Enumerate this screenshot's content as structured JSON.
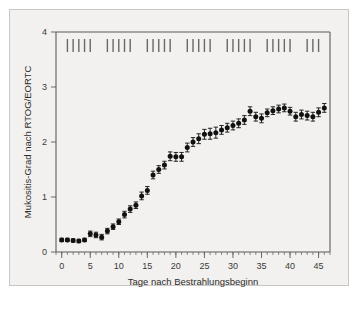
{
  "figure": {
    "background_color": "#f2f1ef",
    "frame_color": "#c9c7c3",
    "marker_color": "#111111",
    "axis_color": "#5d5b58",
    "fraction_tick_color": "#6a6866"
  },
  "chart_data": {
    "type": "scatter",
    "title": "",
    "subtitle": "",
    "xlabel": "Tage nach Bestrahlungsbeginn",
    "ylabel": "Mukositis-Grad nach RTOG/EORTC",
    "xlim": [
      -1,
      47
    ],
    "ylim": [
      0,
      4
    ],
    "xticks": [
      0,
      5,
      10,
      15,
      20,
      25,
      30,
      35,
      40,
      45
    ],
    "xticklabels": [
      "0",
      "5",
      "10",
      "15",
      "20",
      "25",
      "30",
      "35",
      "40",
      "45"
    ],
    "xminor_step": 1,
    "yticks": [
      0,
      1,
      2,
      3,
      4
    ],
    "yticklabels": [
      "0",
      "1",
      "2",
      "3",
      "4"
    ],
    "grid": false,
    "legend": null,
    "legend_position": "none",
    "series": [
      {
        "name": "Mukositis-Grad (Mittelwert ± SEM)",
        "marker": "filled-circle",
        "error_bars": "vertical",
        "x": [
          0,
          1,
          2,
          3,
          4,
          5,
          6,
          7,
          8,
          9,
          10,
          11,
          12,
          13,
          14,
          15,
          16,
          17,
          18,
          19,
          20,
          21,
          22,
          23,
          24,
          25,
          26,
          27,
          28,
          29,
          30,
          31,
          32,
          33,
          34,
          35,
          36,
          37,
          38,
          39,
          40,
          41,
          42,
          43,
          44,
          45,
          46
        ],
        "y": [
          0.22,
          0.22,
          0.21,
          0.2,
          0.22,
          0.33,
          0.31,
          0.27,
          0.38,
          0.46,
          0.55,
          0.68,
          0.78,
          0.85,
          1.02,
          1.12,
          1.4,
          1.5,
          1.58,
          1.74,
          1.73,
          1.73,
          1.9,
          2.0,
          2.06,
          2.14,
          2.15,
          2.17,
          2.22,
          2.26,
          2.3,
          2.34,
          2.4,
          2.56,
          2.46,
          2.43,
          2.53,
          2.57,
          2.6,
          2.62,
          2.56,
          2.46,
          2.5,
          2.48,
          2.46,
          2.54,
          2.62
        ],
        "yerr": [
          0.03,
          0.03,
          0.03,
          0.03,
          0.03,
          0.05,
          0.05,
          0.05,
          0.05,
          0.05,
          0.05,
          0.06,
          0.06,
          0.06,
          0.07,
          0.07,
          0.07,
          0.07,
          0.07,
          0.08,
          0.08,
          0.08,
          0.08,
          0.08,
          0.09,
          0.09,
          0.1,
          0.1,
          0.08,
          0.08,
          0.08,
          0.08,
          0.08,
          0.08,
          0.08,
          0.08,
          0.07,
          0.07,
          0.07,
          0.07,
          0.07,
          0.08,
          0.08,
          0.08,
          0.08,
          0.08,
          0.08
        ]
      }
    ],
    "annotations": {
      "fraction_marks_label": "Bestrahlungsfraktionen",
      "fraction_mark_days": [
        1,
        2,
        3,
        4,
        5,
        8,
        9,
        10,
        11,
        12,
        15,
        16,
        17,
        18,
        19,
        22,
        23,
        24,
        25,
        26,
        29,
        30,
        31,
        32,
        33,
        36,
        37,
        38,
        39,
        40,
        43,
        44,
        45
      ],
      "fraction_mark_count": 33
    }
  }
}
